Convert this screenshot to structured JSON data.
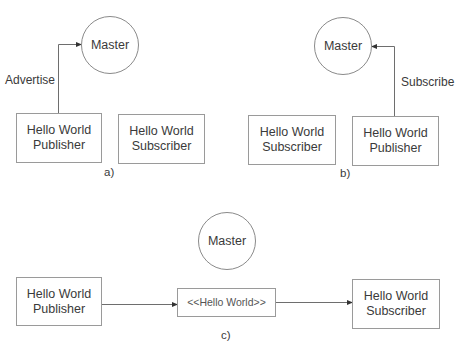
{
  "diagram": {
    "colors": {
      "line": "#6e6e6e",
      "border": "#9a9a9a",
      "text": "#3a3a3a",
      "background": "#ffffff"
    },
    "panel_a": {
      "label": "a)",
      "master": "Master",
      "edge_label": "Advertise",
      "publisher": {
        "line1": "Hello World",
        "line2": "Publisher"
      },
      "subscriber": {
        "line1": "Hello World",
        "line2": "Subscriber"
      }
    },
    "panel_b": {
      "label": "b)",
      "master": "Master",
      "edge_label": "Subscribe",
      "subscriber": {
        "line1": "Hello World",
        "line2": "Subscriber"
      },
      "publisher": {
        "line1": "Hello World",
        "line2": "Publisher"
      }
    },
    "panel_c": {
      "label": "c)",
      "master": "Master",
      "publisher": {
        "line1": "Hello World",
        "line2": "Publisher"
      },
      "message": "<<Hello World>>",
      "subscriber": {
        "line1": "Hello World",
        "line2": "Subscriber"
      }
    }
  }
}
